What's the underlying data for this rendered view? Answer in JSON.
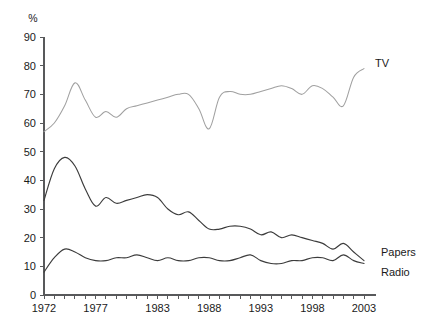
{
  "chart_data": {
    "type": "line",
    "title": "",
    "subtitle": "",
    "xlabel": "",
    "ylabel": "%",
    "unit_label": "%",
    "ylim": [
      0,
      90
    ],
    "xlim": [
      1972,
      2003
    ],
    "grid": false,
    "legend_position": "right-inline",
    "y_ticks": [
      0,
      10,
      20,
      30,
      40,
      50,
      60,
      70,
      80,
      90
    ],
    "y_tick_labels": [
      "0",
      "10",
      "20",
      "30",
      "40",
      "50",
      "60",
      "70",
      "80",
      "90"
    ],
    "x_tick_labels": [
      "1972",
      "1977",
      "1983",
      "1988",
      "1993",
      "1998",
      "2003"
    ],
    "x_tick_label_values": [
      1972,
      1977,
      1983,
      1988,
      1993,
      1998,
      2003
    ],
    "x_minor_tick_years": [
      1972,
      1973,
      1974,
      1975,
      1976,
      1977,
      1978,
      1979,
      1980,
      1981,
      1982,
      1983,
      1984,
      1985,
      1986,
      1987,
      1988,
      1989,
      1990,
      1991,
      1992,
      1993,
      1994,
      1995,
      1996,
      1997,
      1998,
      1999,
      2000,
      2001,
      2002,
      2003
    ],
    "x": [
      1972,
      1973,
      1974,
      1975,
      1976,
      1977,
      1978,
      1979,
      1980,
      1981,
      1982,
      1983,
      1984,
      1985,
      1986,
      1987,
      1988,
      1989,
      1990,
      1991,
      1992,
      1993,
      1994,
      1995,
      1996,
      1997,
      1998,
      1999,
      2000,
      2001,
      2002,
      2003
    ],
    "series": [
      {
        "name": "TV",
        "label": "TV",
        "color": "#a0a0a0",
        "values": [
          57,
          60,
          66,
          74,
          68,
          62,
          64,
          62,
          65,
          66,
          67,
          68,
          69,
          70,
          70,
          65,
          58,
          69,
          71,
          70,
          70,
          71,
          72,
          73,
          72,
          70,
          73,
          72,
          69,
          66,
          76,
          79
        ]
      },
      {
        "name": "Papers",
        "label": "Papers",
        "color": "#3c3c3c",
        "values": [
          33,
          44,
          48,
          45,
          37,
          31,
          34,
          32,
          33,
          34,
          35,
          34,
          30,
          28,
          29,
          26,
          23,
          23,
          24,
          24,
          23,
          21,
          22,
          20,
          21,
          20,
          19,
          18,
          16,
          18,
          15,
          12
        ]
      },
      {
        "name": "Radio",
        "label": "Radio",
        "color": "#3c3c3c",
        "values": [
          8,
          13,
          16,
          15,
          13,
          12,
          12,
          13,
          13,
          14,
          13,
          12,
          13,
          12,
          12,
          13,
          13,
          12,
          12,
          13,
          14,
          12,
          11,
          11,
          12,
          12,
          13,
          13,
          12,
          14,
          12,
          11
        ]
      }
    ],
    "annotations": [
      {
        "text": "TV",
        "series": "TV",
        "x": 375,
        "y": 67
      },
      {
        "text": "Papers",
        "series": "Papers",
        "x": 381,
        "y": 256
      },
      {
        "text": "Radio",
        "series": "Radio",
        "x": 381,
        "y": 276
      }
    ]
  },
  "plot_geometry": {
    "left": 44,
    "right": 364,
    "top": 37,
    "bottom": 295
  }
}
